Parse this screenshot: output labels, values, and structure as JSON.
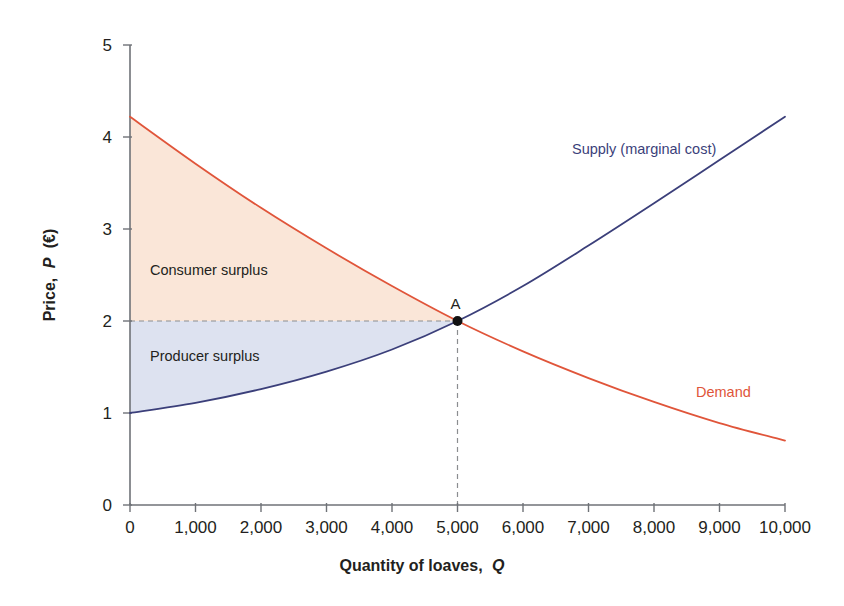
{
  "chart_data": {
    "type": "line",
    "title": "",
    "xlabel": "Quantity of loaves, Q",
    "ylabel": "Price, P (€)",
    "xlim": [
      0,
      10000
    ],
    "ylim": [
      0,
      5
    ],
    "grid": false,
    "legend_position": "inline-labels",
    "x_ticks": [
      "0",
      "1,000",
      "2,000",
      "3,000",
      "4,000",
      "5,000",
      "6,000",
      "7,000",
      "8,000",
      "9,000",
      "10,000"
    ],
    "x_tick_values": [
      0,
      1000,
      2000,
      3000,
      4000,
      5000,
      6000,
      7000,
      8000,
      9000,
      10000
    ],
    "y_ticks": [
      "0",
      "1",
      "2",
      "3",
      "4",
      "5"
    ],
    "y_tick_values": [
      0,
      1,
      2,
      3,
      4,
      5
    ],
    "series": [
      {
        "name": "Supply (marginal cost)",
        "color": "#3b3f7a",
        "x": [
          0,
          1000,
          2000,
          3000,
          4000,
          5000,
          6000,
          7000,
          8000,
          9000,
          10000
        ],
        "values": [
          1.0,
          1.11,
          1.26,
          1.45,
          1.69,
          2.0,
          2.38,
          2.82,
          3.28,
          3.75,
          4.22
        ]
      },
      {
        "name": "Demand",
        "color": "#e0553a",
        "x": [
          0,
          1000,
          2000,
          3000,
          4000,
          5000,
          6000,
          7000,
          8000,
          9000,
          10000
        ],
        "values": [
          4.22,
          3.71,
          3.23,
          2.79,
          2.38,
          2.0,
          1.67,
          1.38,
          1.12,
          0.89,
          0.7
        ]
      }
    ],
    "annotations": [
      {
        "name": "equilibrium-point",
        "label": "A",
        "x": 5000,
        "y": 2.0
      },
      {
        "name": "consumer-surplus-region",
        "label": "Consumer surplus",
        "fill": "#fae6d8"
      },
      {
        "name": "producer-surplus-region",
        "label": "Producer surplus",
        "fill": "#dde2f0"
      },
      {
        "name": "equilibrium-price-guide",
        "style": "dashed",
        "y": 2.0
      },
      {
        "name": "equilibrium-quantity-guide",
        "style": "dashed",
        "x": 5000
      }
    ]
  },
  "labels": {
    "supply": "Supply (marginal cost)",
    "demand": "Demand",
    "consumer_surplus": "Consumer surplus",
    "producer_surplus": "Producer surplus",
    "point_a": "A",
    "x_axis_title_main": "Quantity of loaves,",
    "x_axis_title_var": "Q",
    "y_axis_title_main": "Price,",
    "y_axis_title_var": "P",
    "y_axis_title_unit": "(€)"
  },
  "colors": {
    "supply_line": "#3b3f7a",
    "demand_line": "#e0553a",
    "consumer_surplus_fill": "#fae6d8",
    "producer_surplus_fill": "#dde2f0",
    "axis": "#6f7277",
    "guide_line": "#8b8d90",
    "text": "#231f20"
  }
}
